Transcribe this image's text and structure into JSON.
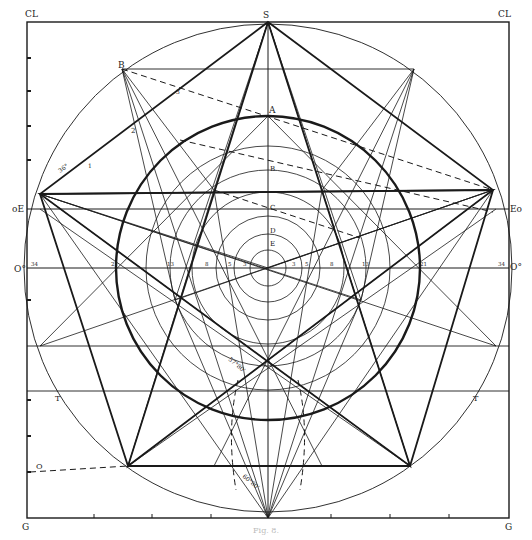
{
  "figure": {
    "frame": {
      "x": 27,
      "y": 22,
      "w": 482,
      "h": 496
    },
    "center": {
      "x": 268,
      "y": 268
    },
    "outer_radius": 244,
    "thick_radius": 152,
    "inner_radii": [
      18,
      34,
      52,
      76,
      98,
      122
    ],
    "colors": {
      "ink": "#1a1a1a",
      "paper": "#ffffff"
    }
  },
  "labels": {
    "corner_tl": "CL",
    "corner_tr": "CL",
    "corner_bl": "G",
    "corner_br": "G",
    "top": "S",
    "left_e": "oE",
    "right_e": "Eo",
    "left_o": "O°",
    "right_o": "O°",
    "b_outer": "B",
    "a": "A",
    "b": "B",
    "c": "C",
    "d": "D",
    "e": "E",
    "t_left": "T",
    "t_right": "T",
    "o_bottom": "O",
    "angle_36": "36°",
    "n1": "1",
    "n2": "2",
    "n3": "3",
    "angle_bottom1": "57°80'",
    "angle_bottom2": "60°80'"
  },
  "scale_left": [
    "34",
    "21",
    "13",
    "8",
    "5",
    "3"
  ],
  "scale_right": [
    "3",
    "5",
    "8",
    "13",
    "21",
    "34"
  ],
  "caption": "Fig. 8."
}
